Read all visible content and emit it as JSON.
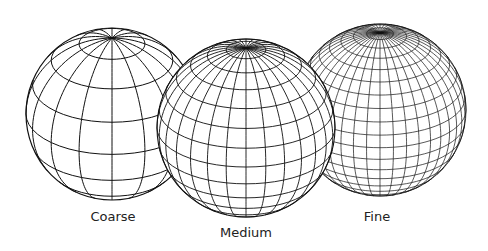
{
  "figure": {
    "background": "#ffffff",
    "stroke_color": "#111111",
    "spheres": [
      {
        "id": "coarse",
        "label": "Coarse",
        "center": [
          112,
          114
        ],
        "radius": 86,
        "tilt_deg": 28,
        "meridians": 16,
        "parallels": 8,
        "stroke_width": 1.0,
        "label_pos": [
          113,
          209
        ],
        "z": 1
      },
      {
        "id": "fine",
        "label": "Fine",
        "center": [
          380,
          110
        ],
        "radius": 86,
        "tilt_deg": 26,
        "meridians": 40,
        "parallels": 20,
        "stroke_width": 0.7,
        "label_pos": [
          377,
          209
        ],
        "z": 2
      },
      {
        "id": "medium",
        "label": "Medium",
        "center": [
          246,
          128
        ],
        "radius": 89,
        "tilt_deg": 26,
        "meridians": 28,
        "parallels": 14,
        "stroke_width": 0.9,
        "label_pos": [
          246,
          225
        ],
        "z": 3
      }
    ]
  }
}
